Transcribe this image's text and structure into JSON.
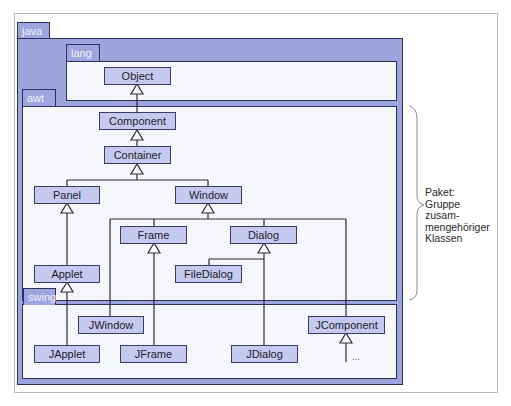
{
  "packages": {
    "java": "java",
    "lang": "lang",
    "awt": "awt",
    "swing": "swing"
  },
  "classes": {
    "object": "Object",
    "component": "Component",
    "container": "Container",
    "panel": "Panel",
    "window": "Window",
    "frame": "Frame",
    "dialog": "Dialog",
    "filedialog": "FileDialog",
    "applet": "Applet",
    "jwindow": "JWindow",
    "japplet": "JApplet",
    "jframe": "JFrame",
    "jdialog": "JDialog",
    "jcomponent": "JComponent",
    "more": "..."
  },
  "annotation": {
    "lines": [
      "Paket:",
      "Gruppe",
      "zusam-",
      "mengehöriger",
      "Klassen"
    ]
  },
  "colors": {
    "package_fill": "#9ea4de",
    "class_fill": "#c5c9f0",
    "border": "#2e3158",
    "package_inner_bg": "#f5f7fc"
  }
}
